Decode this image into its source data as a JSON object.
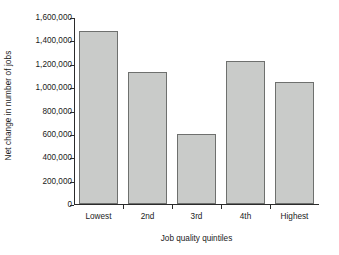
{
  "chart_data": {
    "type": "bar",
    "title": "",
    "xlabel": "Job quality quintiles",
    "ylabel": "Net change in number of jobs",
    "categories": [
      "Lowest",
      "2nd",
      "3rd",
      "4th",
      "Highest"
    ],
    "values": [
      1480000,
      1130000,
      600000,
      1225000,
      1040000
    ],
    "ylim": [
      0,
      1600000
    ],
    "ytick_step": 200000,
    "ytick_labels": [
      "0",
      "200,000",
      "400,000",
      "600,000",
      "800,000",
      "1,000,000",
      "1,200,000",
      "1,400,000",
      "1,600,000"
    ],
    "ytick_values": [
      0,
      200000,
      400000,
      600000,
      800000,
      1000000,
      1200000,
      1400000,
      1600000
    ],
    "grid": false,
    "legend": false,
    "legend_position": "none",
    "bar_fill_color": "#c9cbc9",
    "bar_edge_color": "#6e706e",
    "axis_color": "#2b2b2b",
    "background_color": "#ffffff"
  }
}
